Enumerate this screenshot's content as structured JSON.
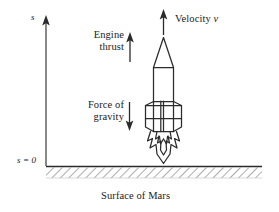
{
  "figure": {
    "caption": "Surface of Mars",
    "axis": {
      "name": "s",
      "origin_label": "s = 0"
    },
    "annotations": {
      "velocity": "Velocity ",
      "velocity_symbol": "v",
      "thrust_line1": "Engine",
      "thrust_line2": "thrust",
      "gravity_line1": "Force of",
      "gravity_line2": "gravity"
    },
    "colors": {
      "ink": "#1a1a1a",
      "stroke": "#2b2b2b",
      "hatch": "#555555",
      "background": "#ffffff"
    }
  }
}
